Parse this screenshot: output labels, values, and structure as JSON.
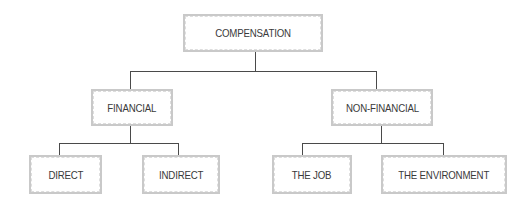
{
  "diagram": {
    "type": "hierarchy-tree",
    "root": {
      "label": "COMPENSATION",
      "children": [
        {
          "label": "FINANCIAL",
          "children": [
            {
              "label": "DIRECT"
            },
            {
              "label": "INDIRECT"
            }
          ]
        },
        {
          "label": "NON-FINANCIAL",
          "children": [
            {
              "label": "THE JOB"
            },
            {
              "label": "THE ENVIRONMENT"
            }
          ]
        }
      ]
    },
    "nodes": {
      "compensation": "COMPENSATION",
      "financial": "FINANCIAL",
      "non_financial": "NON-FINANCIAL",
      "direct": "DIRECT",
      "indirect": "INDIRECT",
      "the_job": "THE JOB",
      "the_environment": "THE ENVIRONMENT"
    },
    "colors": {
      "box_border": "#c9c9c9",
      "connector": "#4a4a4a",
      "text": "#3a3a3a",
      "background": "#ffffff"
    }
  }
}
